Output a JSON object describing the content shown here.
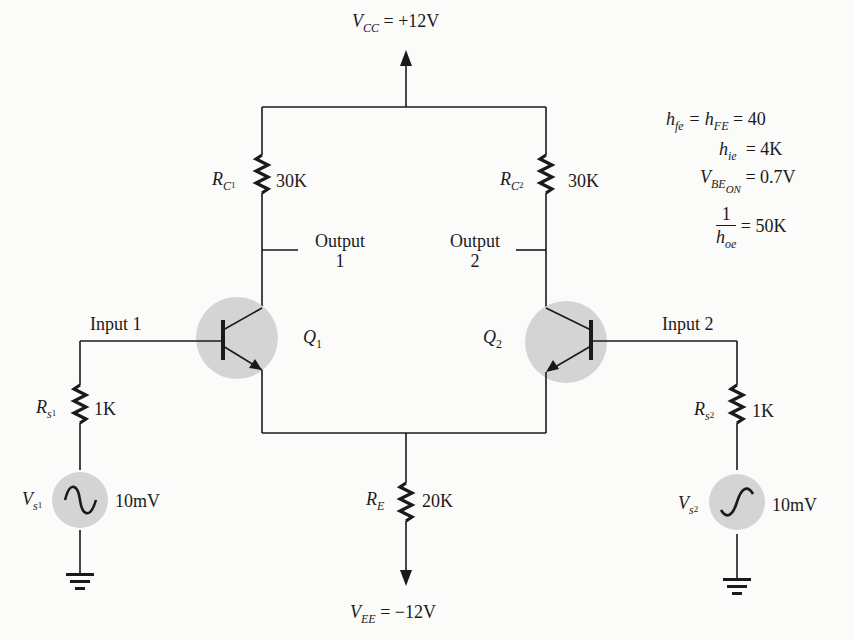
{
  "diagram": {
    "type": "differential-amplifier-circuit",
    "supply_top": {
      "symbol": "V",
      "sub": "CC",
      "value": "= +12V"
    },
    "supply_bottom": {
      "symbol": "V",
      "sub": "EE",
      "value": "= −12V"
    },
    "resistors": {
      "rc1": {
        "symbol": "R",
        "sub": "C",
        "subsub": "1",
        "value": "30K"
      },
      "rc2": {
        "symbol": "R",
        "sub": "C",
        "subsub": "2",
        "value": "30K"
      },
      "rs1": {
        "symbol": "R",
        "sub": "s",
        "subsub": "1",
        "value": "1K"
      },
      "rs2": {
        "symbol": "R",
        "sub": "s",
        "subsub": "2",
        "value": "1K"
      },
      "re": {
        "symbol": "R",
        "sub": "E",
        "value": "20K"
      }
    },
    "sources": {
      "vs1": {
        "symbol": "V",
        "sub": "s",
        "subsub": "1",
        "value": "10mV"
      },
      "vs2": {
        "symbol": "V",
        "sub": "s",
        "subsub": "2",
        "value": "10mV"
      }
    },
    "transistors": {
      "q1": {
        "symbol": "Q",
        "sub": "1"
      },
      "q2": {
        "symbol": "Q",
        "sub": "2"
      }
    },
    "labels": {
      "output1_line1": "Output",
      "output1_line2": "1",
      "output2_line1": "Output",
      "output2_line2": "2",
      "input1": "Input 1",
      "input2": "Input 2"
    },
    "parameters": {
      "hfe": {
        "lhs": "h",
        "lhs_sub": "fe",
        "mid": "= h",
        "mid_sub": "FE",
        "rhs": "= 40"
      },
      "hie": {
        "lhs": "h",
        "lhs_sub": "ie",
        "rhs": "= 4K"
      },
      "vbe": {
        "lhs": "V",
        "lhs_sub": "BE",
        "lhs_subsub": "ON",
        "rhs": "= 0.7V"
      },
      "hoe": {
        "num": "1",
        "den": "h",
        "den_sub": "oe",
        "rhs": "= 50K"
      }
    },
    "colors": {
      "wire": "#1a1a1a",
      "device_fill": "#d4d4d4",
      "background": "#fbfbfa"
    }
  }
}
